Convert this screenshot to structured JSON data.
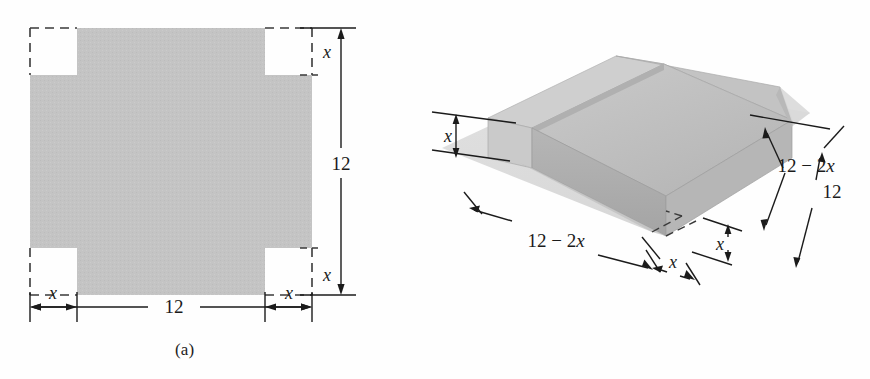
{
  "figure": {
    "colors": {
      "sheet_fill": "#c3c3c3",
      "line": "#1b1b1b",
      "background": "#ffffff",
      "box_top_light": "#d8d8d8",
      "box_side_mid": "#b9b9b9",
      "box_side_dark": "#a8a8a8",
      "ghost_sheet": "#d6d6d6"
    },
    "panels": [
      {
        "id": "a",
        "caption": "(a)",
        "description": "Flat square sheet with square corners of side x removed",
        "labels": {
          "bottom_length": "12",
          "right_height": "12",
          "corner_bottom_left": "x",
          "corner_bottom_right": "x",
          "corner_top_right": "x",
          "corner_right_lower": "x"
        }
      },
      {
        "id": "b",
        "caption": "(b)",
        "description": "Box formed by folding up the flaps, shown above the original flat sheet",
        "labels": {
          "height": "x",
          "front_base": "12 - 2x",
          "front_corner": "x",
          "right_inner": "12 - 2x",
          "right_outer": "12",
          "right_corner": "x"
        }
      }
    ]
  },
  "chart_data": {
    "type": "diagram",
    "sheet_side": 12,
    "cut_corner_side": "x",
    "box_base_side": "12 - 2x",
    "box_height": "x",
    "annotations": [
      {
        "panel": "a",
        "text": "12",
        "role": "overall-width"
      },
      {
        "panel": "a",
        "text": "12",
        "role": "overall-height"
      },
      {
        "panel": "a",
        "text": "x",
        "role": "corner-cut"
      },
      {
        "panel": "b",
        "text": "x",
        "role": "box-height"
      },
      {
        "panel": "b",
        "text": "12 - 2x",
        "role": "base-length"
      },
      {
        "panel": "b",
        "text": "12 - 2x",
        "role": "base-depth"
      },
      {
        "panel": "b",
        "text": "12",
        "role": "sheet-depth"
      },
      {
        "panel": "b",
        "text": "x",
        "role": "corner-cut"
      }
    ]
  },
  "math": {
    "twelve": "12",
    "x": "x",
    "twelve_minus_2x_prefix": "12 ",
    "minus": "−",
    "two": " 2",
    "x_italic": "x"
  }
}
